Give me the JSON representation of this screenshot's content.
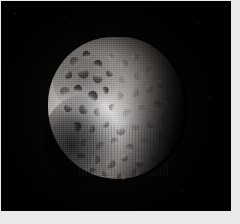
{
  "image": {
    "kind": "spacecraft-photograph",
    "subject": "cratered icy moon",
    "scene_description": "Grayscale space image of a heavily cratered spherical moon, brightly lit from the left, with a dark terminator on the right limb and a dark shadowed region at lower left, set against black space.",
    "color_mode": "grayscale",
    "background_color": "#000000",
    "border_color": "#e9e9e9",
    "plate": {
      "x": 1,
      "y": 1,
      "width": 230,
      "height": 210
    },
    "canvas": {
      "width": 240,
      "height": 224
    }
  },
  "body": {
    "name": "moon-disc",
    "bounds": {
      "x": 47,
      "y": 36,
      "width": 136,
      "height": 142
    },
    "illumination": "lit from left; terminator on right limb",
    "highlight_center": {
      "x": 36,
      "y": 56
    },
    "brightest_value": "#f2f0ee",
    "darkest_value": "#030303",
    "surface": "heavily cratered, ancient, saturated with impact basins"
  },
  "features": {
    "dark_band_label": "dark cratered terrain (upper-left)",
    "dark_lobe_label": "shadowed lower-left region",
    "bright_core_label": "bright sunlit highland",
    "terminator_label": "day-night terminator",
    "limb_label": "sunlit limb"
  },
  "craters": [
    {
      "x": 16,
      "y": 14,
      "r": 7,
      "tone": "dark"
    },
    {
      "x": 26,
      "y": 10,
      "r": 5,
      "tone": "dark"
    },
    {
      "x": 34,
      "y": 16,
      "r": 6,
      "tone": "dark"
    },
    {
      "x": 44,
      "y": 12,
      "r": 4,
      "tone": "soft"
    },
    {
      "x": 53,
      "y": 16,
      "r": 6,
      "tone": "soft"
    },
    {
      "x": 62,
      "y": 12,
      "r": 5,
      "tone": "soft"
    },
    {
      "x": 12,
      "y": 24,
      "r": 6,
      "tone": "dark"
    },
    {
      "x": 22,
      "y": 22,
      "r": 8,
      "tone": "dark"
    },
    {
      "x": 33,
      "y": 26,
      "r": 7,
      "tone": "dark"
    },
    {
      "x": 43,
      "y": 23,
      "r": 5,
      "tone": "dark"
    },
    {
      "x": 52,
      "y": 27,
      "r": 6,
      "tone": "soft"
    },
    {
      "x": 63,
      "y": 24,
      "r": 7,
      "tone": "soft"
    },
    {
      "x": 72,
      "y": 21,
      "r": 5,
      "tone": "soft"
    },
    {
      "x": 9,
      "y": 35,
      "r": 7,
      "tone": "dark"
    },
    {
      "x": 19,
      "y": 34,
      "r": 6,
      "tone": "dark"
    },
    {
      "x": 29,
      "y": 38,
      "r": 8,
      "tone": "dark"
    },
    {
      "x": 40,
      "y": 35,
      "r": 5,
      "tone": "dark"
    },
    {
      "x": 49,
      "y": 39,
      "r": 6,
      "tone": "soft"
    },
    {
      "x": 60,
      "y": 36,
      "r": 7,
      "tone": "soft"
    },
    {
      "x": 71,
      "y": 34,
      "r": 6,
      "tone": "soft"
    },
    {
      "x": 80,
      "y": 31,
      "r": 5,
      "tone": "soft"
    },
    {
      "x": 12,
      "y": 47,
      "r": 6,
      "tone": "dark"
    },
    {
      "x": 23,
      "y": 48,
      "r": 7,
      "tone": "dark"
    },
    {
      "x": 34,
      "y": 50,
      "r": 6,
      "tone": ""
    },
    {
      "x": 45,
      "y": 47,
      "r": 5,
      "tone": ""
    },
    {
      "x": 55,
      "y": 51,
      "r": 7,
      "tone": "soft"
    },
    {
      "x": 66,
      "y": 48,
      "r": 6,
      "tone": "soft"
    },
    {
      "x": 77,
      "y": 45,
      "r": 7,
      "tone": "soft"
    },
    {
      "x": 86,
      "y": 42,
      "r": 5,
      "tone": "soft"
    },
    {
      "x": 18,
      "y": 60,
      "r": 7,
      "tone": "dark"
    },
    {
      "x": 29,
      "y": 62,
      "r": 6,
      "tone": ""
    },
    {
      "x": 40,
      "y": 59,
      "r": 5,
      "tone": ""
    },
    {
      "x": 50,
      "y": 63,
      "r": 7,
      "tone": ""
    },
    {
      "x": 61,
      "y": 60,
      "r": 6,
      "tone": "soft"
    },
    {
      "x": 72,
      "y": 58,
      "r": 7,
      "tone": "soft"
    },
    {
      "x": 83,
      "y": 55,
      "r": 6,
      "tone": "soft"
    },
    {
      "x": 24,
      "y": 72,
      "r": 6,
      "tone": ""
    },
    {
      "x": 35,
      "y": 74,
      "r": 7,
      "tone": ""
    },
    {
      "x": 46,
      "y": 71,
      "r": 5,
      "tone": ""
    },
    {
      "x": 57,
      "y": 75,
      "r": 6,
      "tone": ""
    },
    {
      "x": 68,
      "y": 71,
      "r": 7,
      "tone": "soft"
    },
    {
      "x": 79,
      "y": 68,
      "r": 6,
      "tone": "soft"
    },
    {
      "x": 32,
      "y": 84,
      "r": 6,
      "tone": ""
    },
    {
      "x": 43,
      "y": 86,
      "r": 7,
      "tone": ""
    },
    {
      "x": 54,
      "y": 83,
      "r": 5,
      "tone": ""
    },
    {
      "x": 64,
      "y": 86,
      "r": 6,
      "tone": ""
    },
    {
      "x": 75,
      "y": 82,
      "r": 6,
      "tone": "soft"
    },
    {
      "x": 40,
      "y": 94,
      "r": 5,
      "tone": ""
    },
    {
      "x": 51,
      "y": 96,
      "r": 6,
      "tone": ""
    },
    {
      "x": 62,
      "y": 93,
      "r": 5,
      "tone": ""
    },
    {
      "x": 30,
      "y": 92,
      "r": 5,
      "tone": "dark"
    },
    {
      "x": 21,
      "y": 82,
      "r": 6,
      "tone": "dark"
    }
  ],
  "stars": [
    {
      "x": 14,
      "y": 12
    },
    {
      "x": 196,
      "y": 22
    },
    {
      "x": 208,
      "y": 96
    },
    {
      "x": 36,
      "y": 186
    },
    {
      "x": 180,
      "y": 190
    },
    {
      "x": 64,
      "y": 16
    }
  ]
}
